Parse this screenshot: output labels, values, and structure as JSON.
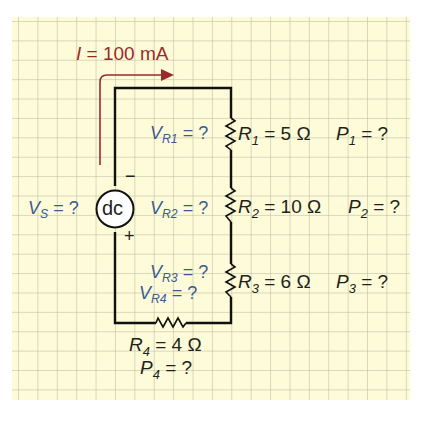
{
  "current": {
    "symbol": "I",
    "eq": " = 100 mA",
    "color": "#9b2a2a"
  },
  "source": {
    "label_symbol": "V",
    "label_sub": "S",
    "label_eq": " = ?",
    "type_text": "dc",
    "minus": "−",
    "plus": "+"
  },
  "resistors": [
    {
      "v_symbol": "V",
      "v_sub": "R1",
      "v_eq": " = ?",
      "r_symbol": "R",
      "r_sub": "1",
      "r_eq": " = 5 Ω",
      "p_symbol": "P",
      "p_sub": "1",
      "p_eq": " = ?"
    },
    {
      "v_symbol": "V",
      "v_sub": "R2",
      "v_eq": " = ?",
      "r_symbol": "R",
      "r_sub": "2",
      "r_eq": " = 10 Ω",
      "p_symbol": "P",
      "p_sub": "2",
      "p_eq": " = ?"
    },
    {
      "v_symbol": "V",
      "v_sub": "R3",
      "v_eq": " = ?",
      "r_symbol": "R",
      "r_sub": "3",
      "r_eq": " = 6 Ω",
      "p_symbol": "P",
      "p_sub": "3",
      "p_eq": " = ?"
    },
    {
      "v_symbol": "V",
      "v_sub": "R4",
      "v_eq": " = ?",
      "r_symbol": "R",
      "r_sub": "4",
      "r_eq": " = 4 Ω",
      "p_symbol": "P",
      "p_sub": "4",
      "p_eq": " = ?"
    }
  ],
  "colors": {
    "background": "#fdfbd8",
    "grid": "#beb9a0",
    "wire": "#111111",
    "label_blue": "#3a5a96",
    "arrow_red": "#9b2a2a"
  }
}
